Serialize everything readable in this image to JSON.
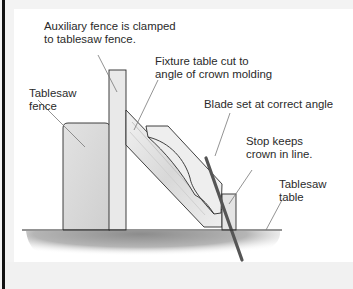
{
  "diagram": {
    "labels": {
      "auxiliary_fence": [
        "Auxiliary fence is clamped",
        "to tablesaw fence."
      ],
      "fixture_table": [
        "Fixture table cut to",
        "angle of crown molding"
      ],
      "tablesaw_fence": [
        "Tablesaw",
        "fence"
      ],
      "blade": [
        "Blade set at correct angle"
      ],
      "stop": [
        "Stop keeps",
        "crown in line."
      ],
      "tablesaw_table": [
        "Tablesaw",
        "table"
      ]
    },
    "colors": {
      "outline": "#2b2b2b",
      "wood_fill": "#e6e6e6",
      "fence_fill": "#d9d9d9",
      "table_shadow": "#9a9a9a",
      "blade": "#555555",
      "leader": "#777777"
    }
  }
}
